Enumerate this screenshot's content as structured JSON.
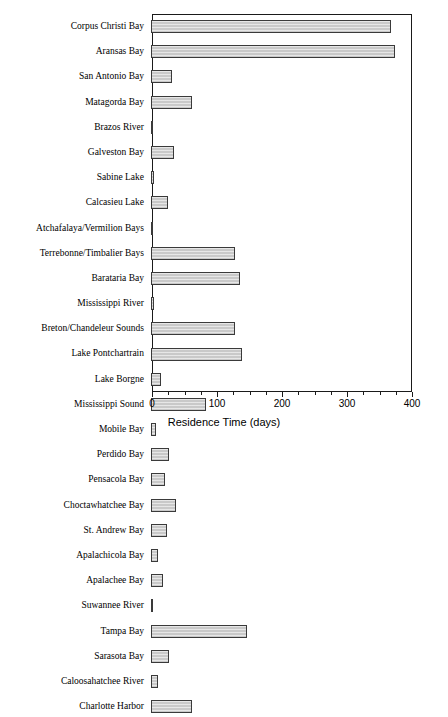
{
  "chart_data": {
    "type": "bar",
    "orientation": "horizontal",
    "title": "",
    "xlabel": "Residence Time (days)",
    "ylabel": "",
    "xlim": [
      0,
      400
    ],
    "ylim": null,
    "grid": false,
    "legend": null,
    "xticks": [
      0,
      100,
      200,
      300,
      400
    ],
    "xtick_labels": [
      "0",
      "100",
      "200",
      "300",
      "400"
    ],
    "xminor_interval": 25,
    "bar_facecolor": "#c9c9c9",
    "bar_edgecolor": "#3a3a3a",
    "axis_color": "#1a1a1a",
    "categories": [
      "Corpus Christi Bay",
      "Aransas Bay",
      "San Antonio Bay",
      "Matagorda Bay",
      "Brazos River",
      "Galveston Bay",
      "Sabine Lake",
      "Calcasieu Lake",
      "Atchafalaya/Vermilion Bays",
      "Terrebonne/Timbalier Bays",
      "Barataria Bay",
      "Mississippi River",
      "Breton/Chandeleur Sounds",
      "Lake Pontchartrain",
      "Lake Borgne",
      "Mississippi Sound",
      "Mobile Bay",
      "Perdido Bay",
      "Pensacola Bay",
      "Choctawhatchee Bay",
      "St. Andrew Bay",
      "Apalachicola Bay",
      "Apalachee Bay",
      "Suwannee River",
      "Tampa Bay",
      "Sarasota Bay",
      "Caloosahatchee River",
      "Charlotte Harbor"
    ],
    "values": [
      369,
      375,
      33,
      63,
      1,
      35,
      5,
      26,
      3,
      129,
      137,
      4,
      129,
      140,
      16,
      85,
      7,
      27,
      22,
      38,
      24,
      10,
      19,
      2,
      148,
      27,
      11,
      63
    ]
  }
}
